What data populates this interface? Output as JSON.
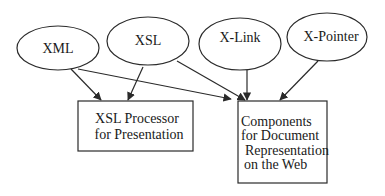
{
  "diagram": {
    "nodes": [
      {
        "id": "xml",
        "label": "XML",
        "shape": "ellipse"
      },
      {
        "id": "xsl",
        "label": "XSL",
        "shape": "ellipse"
      },
      {
        "id": "xlink",
        "label": "X-Link",
        "shape": "ellipse"
      },
      {
        "id": "xpointer",
        "label": "X-Pointer",
        "shape": "ellipse"
      },
      {
        "id": "processor",
        "label_lines": [
          "XSL Processor",
          "for Presentation"
        ],
        "shape": "rectangle"
      },
      {
        "id": "components",
        "label_lines": [
          "Components",
          "for Document",
          "Representation",
          "on the Web"
        ],
        "shape": "rectangle"
      }
    ],
    "edges": [
      {
        "from": "xml",
        "to": "processor"
      },
      {
        "from": "xml",
        "to": "components"
      },
      {
        "from": "xsl",
        "to": "processor"
      },
      {
        "from": "xsl",
        "to": "components"
      },
      {
        "from": "xlink",
        "to": "components"
      },
      {
        "from": "xpointer",
        "to": "components"
      }
    ],
    "colors": {
      "stroke": "#2a2a2a",
      "background": "#ffffff",
      "text": "#1a1a1a"
    }
  }
}
